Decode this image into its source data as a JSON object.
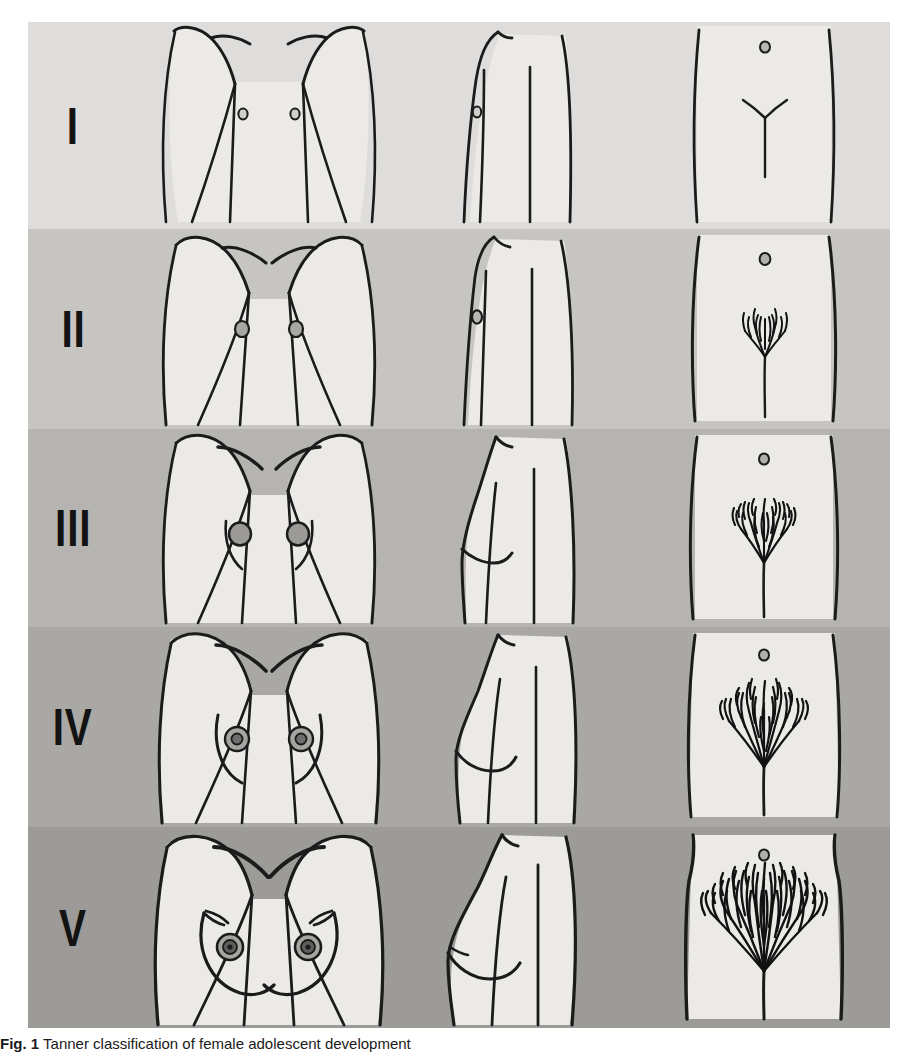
{
  "figure": {
    "caption_label": "Fig. 1",
    "caption_text": "Tanner classification of female adolescent development",
    "panel_columns": [
      "frontal breast view",
      "lateral breast view",
      "pubic hair pattern"
    ]
  },
  "colors": {
    "page_background": "#ffffff",
    "skin_fill": "#eceae6",
    "ink": "#1b1b1b",
    "row_backgrounds": [
      "#dedddb",
      "#c6c5c2",
      "#b5b4b1",
      "#a9a8a5",
      "#9c9b98"
    ],
    "numeral_color": "#131313",
    "areola_fill": "#8f8e8b"
  },
  "rows": [
    {
      "stage": "I",
      "numeral": "I",
      "background": "#dedddb",
      "breast_description": "Prepubertal: elevation of papilla only, flat chest contour",
      "areola_size": "small",
      "pubic_hair": "none",
      "hair_density": 0,
      "hair_spread": 0
    },
    {
      "stage": "II",
      "numeral": "II",
      "background": "#c6c5c2",
      "breast_description": "Breast bud stage: elevation of breast and papilla as small mound, areolar diameter enlarges",
      "areola_size": "enlarging",
      "pubic_hair": "sparse, long, slightly pigmented hair along labia",
      "hair_density": 1,
      "hair_spread": 1
    },
    {
      "stage": "III",
      "numeral": "III",
      "background": "#b5b4b1",
      "breast_description": "Further enlargement of breast and areola with no separation of contours",
      "areola_size": "enlarged",
      "pubic_hair": "darker, coarser, curlier hair spreading sparsely over junction of pubes",
      "hair_density": 2,
      "hair_spread": 2
    },
    {
      "stage": "IV",
      "numeral": "IV",
      "background": "#a9a8a5",
      "breast_description": "Projection of areola and papilla to form secondary mound above level of breast",
      "areola_size": "projecting mound",
      "pubic_hair": "adult type hair, area covered smaller than adult, no spread to medial thighs",
      "hair_density": 3,
      "hair_spread": 3
    },
    {
      "stage": "V",
      "numeral": "V",
      "background": "#9c9b98",
      "breast_description": "Mature stage: projection of papilla only, areola recedes to general breast contour",
      "areola_size": "mature, recessed",
      "pubic_hair": "adult in quantity and type, inverse triangle, spread to medial thighs",
      "hair_density": 4,
      "hair_spread": 4
    }
  ]
}
